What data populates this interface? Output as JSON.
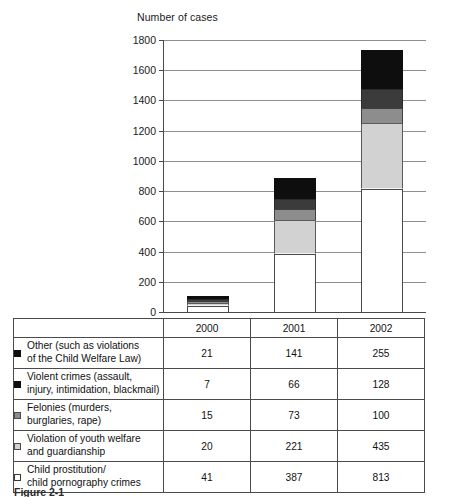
{
  "chart_data": {
    "type": "bar",
    "subtype": "stacked-column",
    "title": "Number of cases",
    "xlabel": "",
    "ylabel": "Number of cases",
    "categories": [
      "2000",
      "2001",
      "2002"
    ],
    "ylim": [
      0,
      1800
    ],
    "ytick_step": 200,
    "yticks": [
      0,
      200,
      400,
      600,
      800,
      1000,
      1200,
      1400,
      1600,
      1800
    ],
    "ytick_labels": [
      "0",
      "200",
      "400",
      "600",
      "800",
      "1000",
      "1200",
      "1400",
      "1600",
      "1800"
    ],
    "grid": true,
    "legend_position": "table-left-column",
    "stack_order_bottom_to_top": [
      "Child prostitution/ child pornography crimes",
      "Violation of youth welfare and guardianship",
      "Felonies (murders, burglaries, rape)",
      "Violent crimes (assault, injury, intimidation, blackmail)",
      "Other (such as violations of the Child Welfare Law)"
    ],
    "series": [
      {
        "name": "Other (such as violations of the Child Welfare Law)",
        "color": "#0e0e0e",
        "swatch": "black",
        "values": [
          21,
          141,
          255
        ]
      },
      {
        "name": "Violent crimes (assault, injury, intimidation, blackmail)",
        "color": "#3b3b3b",
        "swatch": "black",
        "values": [
          7,
          66,
          128
        ]
      },
      {
        "name": "Felonies (murders, burglaries, rape)",
        "color": "#8d8d8d",
        "swatch": "mid-gray",
        "values": [
          15,
          73,
          100
        ]
      },
      {
        "name": "Violation of youth welfare and guardianship",
        "color": "#d2d2d2",
        "swatch": "light-gray",
        "values": [
          20,
          221,
          435
        ]
      },
      {
        "name": "Child prostitution/ child pornography crimes",
        "color": "#ffffff",
        "swatch": "white",
        "values": [
          41,
          387,
          813
        ]
      }
    ],
    "totals": [
      104,
      888,
      1731
    ]
  },
  "chart": {
    "axis_title": "Number of cases",
    "y_labels": {
      "t1800": "1800",
      "t1600": "1600",
      "t1400": "1400",
      "t1200": "1200",
      "t1000": "1000",
      "t800": "800",
      "t600": "600",
      "t400": "400",
      "t200": "200",
      "t0": "0"
    }
  },
  "table": {
    "header": {
      "year_2000": "2000",
      "year_2001": "2001",
      "year_2002": "2002"
    },
    "rows": [
      {
        "label_line1": "Other (such as violations",
        "label_line2": "of the Child Welfare Law)",
        "swatch": "black",
        "v2000": "21",
        "v2001": "141",
        "v2002": "255"
      },
      {
        "label_line1": "Violent crimes (assault,",
        "label_line2": "injury, intimidation, blackmail)",
        "swatch": "black",
        "v2000": "7",
        "v2001": "66",
        "v2002": "128"
      },
      {
        "label_line1": "Felonies (murders,",
        "label_line2": "burglaries, rape)",
        "swatch": "mid-gray",
        "v2000": "15",
        "v2001": "73",
        "v2002": "100"
      },
      {
        "label_line1": "Violation of youth welfare",
        "label_line2": "and guardianship",
        "swatch": "light-gray",
        "v2000": "20",
        "v2001": "221",
        "v2002": "435"
      },
      {
        "label_line1": "Child prostitution/",
        "label_line2": "child pornography crimes",
        "swatch": "white",
        "v2000": "41",
        "v2001": "387",
        "v2002": "813"
      }
    ]
  },
  "footer": {
    "caption": "Figure 2-1"
  },
  "colors": {
    "black": "#0e0e0e",
    "dark_gray": "#3b3b3b",
    "mid_gray": "#8d8d8d",
    "light_gray": "#d2d2d2",
    "white": "#ffffff",
    "gridline": "#8e8e8e",
    "axis": "#4a4a4a"
  }
}
